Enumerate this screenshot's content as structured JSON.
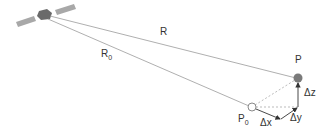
{
  "diagram": {
    "labels": {
      "R": "R",
      "R0": "R",
      "R0_sub": "0",
      "P": "P",
      "P0": "P",
      "P0_sub": "0",
      "dx": "Δx",
      "dy": "Δy",
      "dz": "Δz"
    },
    "colors": {
      "line": "#9a9a9a",
      "point_P": "#7a7a7a",
      "point_P0_fill": "#ffffff",
      "point_P0_stroke": "#8a8a8a",
      "satellite_body": "#6a6a6a",
      "solar_panel": "#a8a8a8",
      "arrow": "#333333"
    }
  }
}
